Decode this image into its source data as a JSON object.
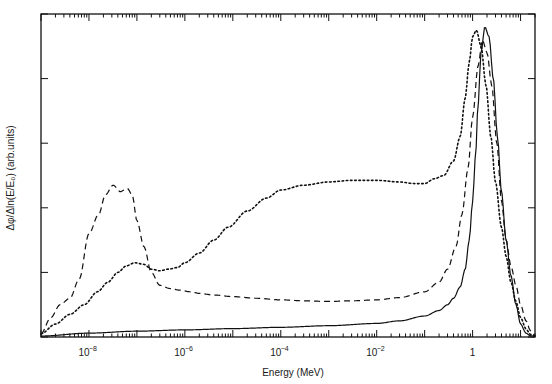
{
  "figure": {
    "name": "neutron-energy-spectrum-plot",
    "background": "#ffffff",
    "ink": "#111111"
  },
  "chart_data": {
    "type": "line",
    "title": "",
    "subtitle": "",
    "xlabel": "Energy (MeV)",
    "ylabel": "Δφ/Δln(E/E₀)  (arb.units)",
    "xscale": "log",
    "yscale": "linear",
    "xlim": [
      1e-09,
      20
    ],
    "ylim": [
      0,
      1.0
    ],
    "grid": false,
    "legend": "none",
    "xticks_major": [
      {
        "value": 1e-08,
        "label": "10",
        "exp": "−8"
      },
      {
        "value": 1e-06,
        "label": "10",
        "exp": "−6"
      },
      {
        "value": 0.0001,
        "label": "10",
        "exp": "−4"
      },
      {
        "value": 0.01,
        "label": "10",
        "exp": "−2"
      },
      {
        "value": 1,
        "label": "1",
        "exp": ""
      }
    ],
    "xticks_decades": [
      1e-09,
      1e-08,
      1e-07,
      1e-06,
      1e-05,
      0.0001,
      0.001,
      0.01,
      0.1,
      1,
      10
    ],
    "yticks_major": [
      0.0,
      0.2,
      0.4,
      0.6,
      0.8,
      1.0
    ],
    "series": [
      {
        "name": "curve-dashed",
        "style": "dashed",
        "x": [
          1e-09,
          1.6e-09,
          2.5e-09,
          4e-09,
          6.3e-09,
          1e-08,
          1.6e-08,
          2.2e-08,
          3.2e-08,
          4.5e-08,
          6.3e-08,
          8e-08,
          1e-07,
          1.4e-07,
          2e-07,
          3e-07,
          5e-07,
          8e-07,
          1.3e-06,
          2e-06,
          4e-06,
          1e-05,
          3e-05,
          0.0001,
          0.0003,
          0.001,
          0.003,
          0.01,
          0.03,
          0.1,
          0.2,
          0.3,
          0.45,
          0.6,
          0.8,
          1.0,
          1.3,
          1.6,
          2.0,
          2.5,
          3.2,
          4.0,
          5.0,
          6.3,
          8.0,
          10.0,
          13.0,
          16.0,
          20.0
        ],
        "y": [
          0.01,
          0.06,
          0.1,
          0.12,
          0.18,
          0.32,
          0.38,
          0.44,
          0.47,
          0.45,
          0.46,
          0.44,
          0.36,
          0.28,
          0.2,
          0.16,
          0.15,
          0.145,
          0.14,
          0.135,
          0.13,
          0.125,
          0.12,
          0.115,
          0.112,
          0.11,
          0.112,
          0.115,
          0.122,
          0.14,
          0.17,
          0.21,
          0.28,
          0.38,
          0.52,
          0.68,
          0.84,
          0.92,
          0.88,
          0.78,
          0.6,
          0.42,
          0.3,
          0.22,
          0.16,
          0.1,
          0.05,
          0.02,
          0.005
        ]
      },
      {
        "name": "curve-dotted",
        "style": "dotted",
        "x": [
          1e-09,
          2e-09,
          4e-09,
          8e-09,
          1.5e-08,
          2.5e-08,
          4e-08,
          6e-08,
          9e-08,
          1.4e-07,
          2e-07,
          3e-07,
          4.5e-07,
          7e-07,
          1e-06,
          2e-06,
          4e-06,
          8e-06,
          2e-05,
          5e-05,
          0.0001,
          0.0003,
          0.001,
          0.003,
          0.01,
          0.03,
          0.06,
          0.1,
          0.16,
          0.25,
          0.4,
          0.55,
          0.7,
          0.85,
          1.0,
          1.2,
          1.5,
          1.9,
          2.4,
          3.0,
          4.0,
          5.0,
          6.3,
          8.0,
          10.0,
          13.0,
          16.0,
          20.0
        ],
        "y": [
          0.01,
          0.04,
          0.07,
          0.1,
          0.14,
          0.17,
          0.2,
          0.22,
          0.23,
          0.225,
          0.21,
          0.205,
          0.21,
          0.215,
          0.23,
          0.26,
          0.3,
          0.34,
          0.39,
          0.43,
          0.455,
          0.47,
          0.48,
          0.485,
          0.485,
          0.48,
          0.475,
          0.475,
          0.49,
          0.5,
          0.545,
          0.62,
          0.74,
          0.85,
          0.93,
          0.95,
          0.9,
          0.78,
          0.62,
          0.48,
          0.34,
          0.25,
          0.17,
          0.11,
          0.06,
          0.025,
          0.008,
          0.003
        ]
      },
      {
        "name": "curve-solid",
        "style": "solid",
        "x": [
          1e-09,
          1e-08,
          1e-07,
          1e-06,
          1e-05,
          0.0001,
          0.001,
          0.01,
          0.03,
          0.1,
          0.2,
          0.3,
          0.4,
          0.55,
          0.7,
          0.85,
          1.0,
          1.15,
          1.3,
          1.5,
          1.8,
          2.2,
          2.7,
          3.3,
          4.0,
          5.0,
          6.3,
          8.0,
          10.0,
          13.0,
          16.0,
          20.0
        ],
        "y": [
          0.003,
          0.012,
          0.018,
          0.022,
          0.026,
          0.03,
          0.035,
          0.042,
          0.05,
          0.065,
          0.082,
          0.1,
          0.12,
          0.155,
          0.21,
          0.3,
          0.42,
          0.56,
          0.72,
          0.88,
          0.96,
          0.93,
          0.8,
          0.62,
          0.45,
          0.3,
          0.19,
          0.1,
          0.04,
          0.012,
          0.004,
          0.002
        ]
      }
    ]
  }
}
